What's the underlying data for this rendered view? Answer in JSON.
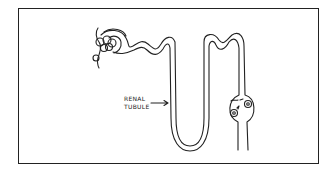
{
  "diagram": {
    "labels": [
      {
        "line1": "RENAL",
        "line2": "TUBULE",
        "points_to": "descending limb of tubule"
      }
    ],
    "parts": [
      "glomerulus",
      "bowman-capsule",
      "proximal-convoluted-tubule",
      "loop-of-henle",
      "distal-convoluted-tubule",
      "collecting-duct-bulge-with-cells"
    ],
    "colors": {
      "line": "#222222",
      "background": "#ffffff"
    }
  }
}
